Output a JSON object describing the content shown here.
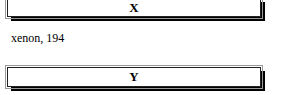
{
  "boxes": [
    {
      "label": "X"
    },
    {
      "label": "Y"
    }
  ],
  "caption": "xenon, 194"
}
